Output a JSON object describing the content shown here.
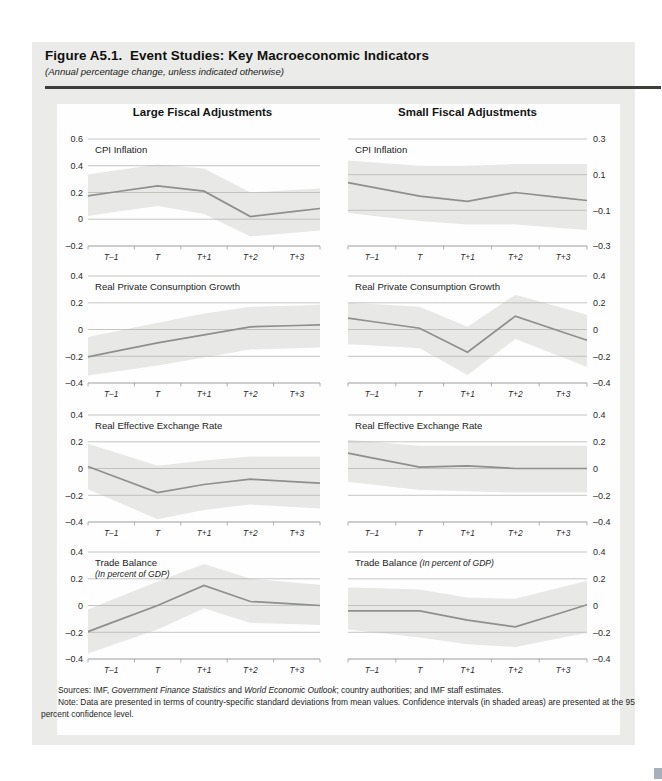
{
  "header": {
    "title": "Figure A5.1.  Event Studies: Key Macroeconomic Indicators",
    "subtitle": "(Annual percentage change, unless indicated otherwise)"
  },
  "columns": [
    {
      "title": "Large Fiscal Adjustments"
    },
    {
      "title": "Small Fiscal Adjustments"
    }
  ],
  "footer": {
    "sources_parts": [
      {
        "t": "Sources: IMF, ",
        "i": false
      },
      {
        "t": "Government Finance Statistics",
        "i": true
      },
      {
        "t": " and ",
        "i": false
      },
      {
        "t": "World Economic Outlook",
        "i": true
      },
      {
        "t": "; country authorities; and IMF staff estimates.",
        "i": false
      }
    ],
    "note": "Note: Data are presented in terms of country-specific standard deviations from mean values. Confidence intervals (in shaded areas) are presented at the 95 percent confidence level."
  },
  "style": {
    "figure_bg": "#ebece9",
    "panel_bg": "#fefefe",
    "band_color": "#e8e9e7",
    "grid_color": "#b6b8b4",
    "axis_color": "#9b9d9b",
    "line_color": "#8d908c",
    "text_color": "#2a2a2a",
    "title_color": "#1c1c1c",
    "rule_color": "#3d3d3b",
    "accent_color": "#a6afba"
  },
  "chart_data": [
    {
      "type": "line",
      "column": "large",
      "title": "CPI Inflation",
      "subtitle": null,
      "subtitle_inline": false,
      "axis_side": "left",
      "ymin": -0.2,
      "ymax": 0.6,
      "yticks": [
        {
          "v": 0.6,
          "label": "0.6"
        },
        {
          "v": 0.4,
          "label": "0.4"
        },
        {
          "v": 0.2,
          "label": "0.2"
        },
        {
          "v": 0,
          "label": "0"
        },
        {
          "v": -0.2,
          "label": "–0.2"
        }
      ],
      "categories": [
        "T–1",
        "T",
        "T+1",
        "T+2",
        "T+3"
      ],
      "line": [
        0.2,
        0.25,
        0.21,
        0.02,
        0.06
      ],
      "band_upper": [
        0.36,
        0.41,
        0.38,
        0.2,
        0.22
      ],
      "band_lower": [
        0.05,
        0.1,
        0.04,
        -0.13,
        -0.1
      ]
    },
    {
      "type": "line",
      "column": "small",
      "title": "CPI Inflation",
      "subtitle": null,
      "subtitle_inline": false,
      "axis_side": "right",
      "ymin": -0.3,
      "ymax": 0.3,
      "yticks": [
        {
          "v": 0.3,
          "label": "0.3"
        },
        {
          "v": 0.1,
          "label": "0.1"
        },
        {
          "v": -0.1,
          "label": "–0.1"
        },
        {
          "v": -0.3,
          "label": "–0.3"
        }
      ],
      "categories": [
        "T–1",
        "T",
        "T+1",
        "T+2",
        "T+3"
      ],
      "line": [
        0.03,
        -0.02,
        -0.05,
        0.0,
        -0.03
      ],
      "band_upper": [
        0.17,
        0.15,
        0.15,
        0.16,
        0.16
      ],
      "band_lower": [
        -0.13,
        -0.16,
        -0.18,
        -0.18,
        -0.2
      ]
    },
    {
      "type": "line",
      "column": "large",
      "title": "Real Private Consumption Growth",
      "subtitle": null,
      "subtitle_inline": false,
      "axis_side": "left",
      "ymin": -0.4,
      "ymax": 0.4,
      "yticks": [
        {
          "v": 0.4,
          "label": "0.4"
        },
        {
          "v": 0.2,
          "label": "0.2"
        },
        {
          "v": 0,
          "label": "0"
        },
        {
          "v": -0.2,
          "label": "–0.2"
        },
        {
          "v": -0.4,
          "label": "–0.4"
        }
      ],
      "categories": [
        "T–1",
        "T",
        "T+1",
        "T+2",
        "T+3"
      ],
      "line": [
        -0.17,
        -0.1,
        -0.04,
        0.02,
        0.03
      ],
      "band_upper": [
        -0.02,
        0.05,
        0.12,
        0.17,
        0.18
      ],
      "band_lower": [
        -0.32,
        -0.27,
        -0.21,
        -0.15,
        -0.14
      ]
    },
    {
      "type": "line",
      "column": "small",
      "title": "Real Private Consumption Growth",
      "subtitle": null,
      "subtitle_inline": false,
      "axis_side": "right",
      "ymin": -0.4,
      "ymax": 0.4,
      "yticks": [
        {
          "v": 0.4,
          "label": "0.4"
        },
        {
          "v": 0.2,
          "label": "0.2"
        },
        {
          "v": 0,
          "label": "0"
        },
        {
          "v": -0.2,
          "label": "–0.2"
        },
        {
          "v": -0.4,
          "label": "–0.4"
        }
      ],
      "categories": [
        "T–1",
        "T",
        "T+1",
        "T+2",
        "T+3"
      ],
      "line": [
        0.06,
        0.01,
        -0.17,
        0.1,
        -0.02
      ],
      "band_upper": [
        0.19,
        0.17,
        0.02,
        0.26,
        0.16
      ],
      "band_lower": [
        -0.12,
        -0.14,
        -0.34,
        -0.07,
        -0.21
      ]
    },
    {
      "type": "line",
      "column": "large",
      "title": "Real Effective Exchange Rate",
      "subtitle": null,
      "subtitle_inline": false,
      "axis_side": "left",
      "ymin": -0.4,
      "ymax": 0.4,
      "yticks": [
        {
          "v": 0.4,
          "label": "0.4"
        },
        {
          "v": 0.2,
          "label": "0.2"
        },
        {
          "v": 0,
          "label": "0"
        },
        {
          "v": -0.2,
          "label": "–0.2"
        },
        {
          "v": -0.4,
          "label": "–0.4"
        }
      ],
      "categories": [
        "T–1",
        "T",
        "T+1",
        "T+2",
        "T+3"
      ],
      "line": [
        -0.05,
        -0.18,
        -0.12,
        -0.08,
        -0.1
      ],
      "band_upper": [
        0.13,
        0.02,
        0.06,
        0.09,
        0.09
      ],
      "band_lower": [
        -0.23,
        -0.38,
        -0.31,
        -0.27,
        -0.29
      ]
    },
    {
      "type": "line",
      "column": "small",
      "title": "Real Effective Exchange Rate",
      "subtitle": null,
      "subtitle_inline": false,
      "axis_side": "right",
      "ymin": -0.4,
      "ymax": 0.4,
      "yticks": [
        {
          "v": 0.4,
          "label": "0.4"
        },
        {
          "v": 0.2,
          "label": "0.2"
        },
        {
          "v": 0,
          "label": "0"
        },
        {
          "v": -0.2,
          "label": "–0.2"
        },
        {
          "v": -0.4,
          "label": "–0.4"
        }
      ],
      "categories": [
        "T–1",
        "T",
        "T+1",
        "T+2",
        "T+3"
      ],
      "line": [
        0.08,
        0.01,
        0.02,
        0.0,
        0.0
      ],
      "band_upper": [
        0.2,
        0.17,
        0.17,
        0.17,
        0.17
      ],
      "band_lower": [
        -0.12,
        -0.16,
        -0.17,
        -0.18,
        -0.18
      ]
    },
    {
      "type": "line",
      "column": "large",
      "title": "Trade Balance",
      "subtitle": "(In percent of GDP)",
      "subtitle_inline": false,
      "axis_side": "left",
      "ymin": -0.4,
      "ymax": 0.4,
      "yticks": [
        {
          "v": 0.4,
          "label": "0.4"
        },
        {
          "v": 0.2,
          "label": "0.2"
        },
        {
          "v": 0,
          "label": "0"
        },
        {
          "v": -0.2,
          "label": "–0.2"
        },
        {
          "v": -0.4,
          "label": "–0.4"
        }
      ],
      "categories": [
        "T–1",
        "T",
        "T+1",
        "T+2",
        "T+3"
      ],
      "line": [
        -0.13,
        0.0,
        0.15,
        0.03,
        0.01
      ],
      "band_upper": [
        0.04,
        0.18,
        0.31,
        0.2,
        0.17
      ],
      "band_lower": [
        -0.3,
        -0.18,
        -0.02,
        -0.13,
        -0.14
      ]
    },
    {
      "type": "line",
      "column": "small",
      "title": "Trade Balance",
      "subtitle": "(In percent of GDP)",
      "subtitle_inline": true,
      "axis_side": "right",
      "ymin": -0.4,
      "ymax": 0.4,
      "yticks": [
        {
          "v": 0.4,
          "label": "0.4"
        },
        {
          "v": 0.2,
          "label": "0.2"
        },
        {
          "v": 0,
          "label": "0"
        },
        {
          "v": -0.2,
          "label": "–0.2"
        },
        {
          "v": -0.4,
          "label": "–0.4"
        }
      ],
      "categories": [
        "T–1",
        "T",
        "T+1",
        "T+2",
        "T+3"
      ],
      "line": [
        -0.04,
        -0.04,
        -0.11,
        -0.16,
        -0.05
      ],
      "band_upper": [
        0.13,
        0.12,
        0.06,
        0.05,
        0.14
      ],
      "band_lower": [
        -0.2,
        -0.24,
        -0.29,
        -0.31,
        -0.24
      ]
    }
  ]
}
